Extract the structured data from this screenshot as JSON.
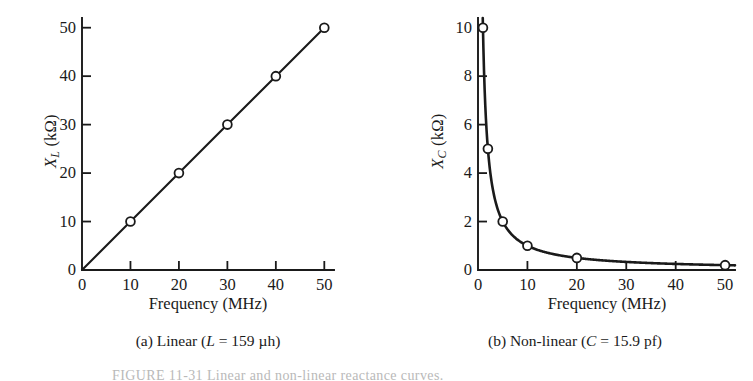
{
  "figure": {
    "caption": "FIGURE 11-31  Linear and non-linear reactance curves.",
    "background_color": "#ffffff",
    "ink_color": "#1a1a1a"
  },
  "panels": [
    {
      "key": "a",
      "subcaption": "(a) Linear (L = 159 µh)",
      "subcaption_parts": {
        "prefix": "(a) Linear (",
        "symbol": "L",
        "middle": " = 159 µh)"
      },
      "ylabel_parts": {
        "symbol": "X",
        "subscript": "L",
        "unit": " (kΩ)"
      },
      "xlabel": "Frequency (MHz)",
      "chart_data": {
        "type": "line",
        "title": "(a) Linear (L = 159 µh)",
        "xlabel": "Frequency (MHz)",
        "ylabel": "X_L (kΩ)",
        "xlim": [
          0,
          52
        ],
        "ylim": [
          0,
          52
        ],
        "xticks": [
          0,
          10,
          20,
          30,
          40,
          50
        ],
        "xticklabels": [
          "0",
          "10",
          "20",
          "30",
          "40",
          "50"
        ],
        "yticks": [
          0,
          10,
          20,
          30,
          40,
          50
        ],
        "yticklabels": [
          "0",
          "10",
          "20",
          "30",
          "40",
          "50"
        ],
        "grid": false,
        "legend": false,
        "marker": "open-circle",
        "x": [
          0,
          10,
          20,
          30,
          40,
          50
        ],
        "values": [
          0,
          10,
          20,
          30,
          40,
          50
        ],
        "series": [
          {
            "name": "X_L",
            "x": [
              0,
              10,
              20,
              30,
              40,
              50
            ],
            "values": [
              0,
              10,
              20,
              30,
              40,
              50
            ]
          }
        ]
      }
    },
    {
      "key": "b",
      "subcaption": "(b) Non-linear (C = 15.9 pf)",
      "subcaption_parts": {
        "prefix": "(b) Non-linear (",
        "symbol": "C",
        "middle": " = 15.9 pf)"
      },
      "ylabel_parts": {
        "symbol": "X",
        "subscript": "C",
        "unit": " (kΩ)"
      },
      "xlabel": "Frequency (MHz)",
      "chart_data": {
        "type": "line",
        "title": "(b) Non-linear (C = 15.9 pf)",
        "xlabel": "Frequency (MHz)",
        "ylabel": "X_C (kΩ)",
        "xlim": [
          0,
          52
        ],
        "ylim": [
          0,
          10.4
        ],
        "xticks": [
          0,
          10,
          20,
          30,
          40,
          50
        ],
        "xticklabels": [
          "0",
          "10",
          "20",
          "30",
          "40",
          "50"
        ],
        "yticks": [
          0,
          2,
          4,
          6,
          8,
          10
        ],
        "yticklabels": [
          "0",
          "2",
          "4",
          "6",
          "8",
          "10"
        ],
        "grid": false,
        "legend": false,
        "marker": "open-circle",
        "x": [
          1,
          2,
          5,
          10,
          20,
          50
        ],
        "values": [
          10,
          5,
          2,
          1,
          0.5,
          0.2
        ],
        "series": [
          {
            "name": "X_C",
            "x": [
              1,
              2,
              5,
              10,
              20,
              50
            ],
            "values": [
              10,
              5,
              2,
              1,
              0.5,
              0.2
            ]
          }
        ]
      }
    }
  ]
}
